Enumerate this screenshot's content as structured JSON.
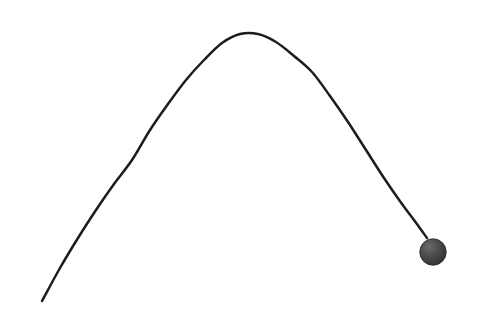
{
  "canvas": {
    "width": 480,
    "height": 320,
    "background_color": "#ffffff"
  },
  "scene": {
    "name": "projectile-trajectory",
    "description": "A thin dark parabolic arc rising from the lower left, peaking near the top center, and descending steeply to the right where it terminates at a dark gray sphere."
  },
  "chart_data": {
    "type": "line",
    "title": "",
    "subtitle": "",
    "xlabel": "",
    "ylabel": "",
    "grid": false,
    "legend": null,
    "axes_visible": false,
    "tick_labels": [],
    "xlim": [
      0,
      480
    ],
    "ylim": [
      320,
      0
    ],
    "series": [
      {
        "name": "trajectory",
        "stroke_color": "#1c1c1c",
        "stroke_width": 2.5,
        "points": [
          [
            42,
            301
          ],
          [
            60,
            268
          ],
          [
            78,
            238
          ],
          [
            96,
            210
          ],
          [
            114,
            184
          ],
          [
            132,
            160
          ],
          [
            150,
            130
          ],
          [
            168,
            104
          ],
          [
            186,
            80
          ],
          [
            204,
            60
          ],
          [
            222,
            43
          ],
          [
            240,
            34
          ],
          [
            258,
            34
          ],
          [
            276,
            42
          ],
          [
            294,
            56
          ],
          [
            312,
            72
          ],
          [
            330,
            96
          ],
          [
            348,
            122
          ],
          [
            366,
            150
          ],
          [
            384,
            178
          ],
          [
            402,
            204
          ],
          [
            414,
            220
          ],
          [
            427,
            238
          ]
        ]
      }
    ],
    "markers": [
      {
        "name": "ball",
        "shape": "circle",
        "cx": 433,
        "cy": 252,
        "r": 13.5,
        "fill_color": "#4a4a4a",
        "edge_color": "#2e2e2e",
        "highlight_color": "#6e6e6e",
        "shadow_color": "#343434"
      }
    ],
    "annotations": []
  }
}
